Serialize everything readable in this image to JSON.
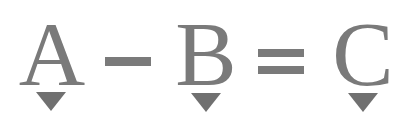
{
  "equation": {
    "terms": [
      {
        "label": "A",
        "marker": "down-triangle"
      },
      {
        "label": "B",
        "marker": "down-triangle"
      },
      {
        "label": "C",
        "marker": "down-triangle"
      }
    ],
    "operators": [
      "minus",
      "equals"
    ]
  },
  "colors": {
    "glyph": "#7a7a7a",
    "marker": "#707070",
    "background": "#ffffff"
  }
}
